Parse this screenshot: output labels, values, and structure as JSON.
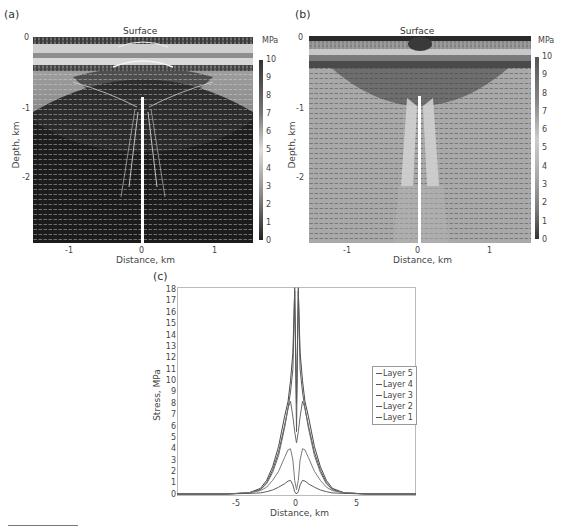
{
  "panels": {
    "a": {
      "label": "(a)",
      "surface_label": "Surface",
      "colorbar_unit": "MPa",
      "colorbar_ticks": [
        "10",
        "9",
        "8",
        "7",
        "6",
        "5",
        "4",
        "3",
        "2",
        "1",
        "0"
      ],
      "y_ticks": [
        "0",
        "-1",
        "-2"
      ],
      "x_ticks": [
        "-1",
        "0",
        "1"
      ],
      "ylabel": "Depth, km",
      "xlabel": "Distance, km",
      "colormap": "dark (low) to light (high)"
    },
    "b": {
      "label": "(b)",
      "surface_label": "Surface",
      "colorbar_unit": "MPa",
      "colorbar_ticks": [
        "10",
        "9",
        "8",
        "7",
        "6",
        "5",
        "4",
        "3",
        "2",
        "1",
        "0"
      ],
      "y_ticks": [
        "0",
        "-1",
        "-2"
      ],
      "x_ticks": [
        "-1",
        "0",
        "1"
      ],
      "ylabel": "Depth, km",
      "xlabel": "Distance, km",
      "colormap": "grey (low) to light/dark (high)"
    },
    "c": {
      "label": "(c)"
    }
  },
  "chart_data": [
    {
      "type": "heatmap",
      "title": "(a)",
      "annotation": "Surface",
      "xlabel": "Distance, km",
      "ylabel": "Depth, km",
      "xlim": [
        -1.5,
        1.5
      ],
      "ylim": [
        -2.9,
        0
      ],
      "x_ticks": [
        -1,
        0,
        1
      ],
      "y_ticks": [
        0,
        -1,
        -2
      ],
      "colorbar": {
        "label": "MPa",
        "range": [
          0,
          10
        ],
        "ticks": [
          0,
          1,
          2,
          3,
          4,
          5,
          6,
          7,
          8,
          9,
          10
        ]
      },
      "overlay": "stress direction vector field (white arrows)"
    },
    {
      "type": "heatmap",
      "title": "(b)",
      "annotation": "Surface",
      "xlabel": "Distance, km",
      "ylabel": "Depth, km",
      "xlim": [
        -1.5,
        1.5
      ],
      "ylim": [
        -2.9,
        0
      ],
      "x_ticks": [
        -1,
        0,
        1
      ],
      "y_ticks": [
        0,
        -1,
        -2
      ],
      "colorbar": {
        "label": "MPa",
        "range": [
          0,
          10
        ],
        "ticks": [
          0,
          1,
          2,
          3,
          4,
          5,
          6,
          7,
          8,
          9,
          10
        ]
      },
      "overlay": "stress direction vector field (dark arrows)"
    },
    {
      "type": "line",
      "title": "(c)",
      "xlabel": "Distance, km",
      "ylabel": "Stress, MPa",
      "xlim": [
        -10,
        10
      ],
      "ylim": [
        0,
        18
      ],
      "x_ticks": [
        -5,
        0,
        5
      ],
      "y_ticks": [
        0,
        1,
        2,
        3,
        4,
        5,
        6,
        7,
        8,
        9,
        10,
        11,
        12,
        13,
        14,
        15,
        16,
        17,
        18
      ],
      "legend_position": "right",
      "x": [
        -10,
        -8,
        -6,
        -4,
        -3,
        -2.5,
        -2,
        -1.5,
        -1,
        -0.7,
        -0.5,
        -0.3,
        -0.15,
        0,
        0.15,
        0.3,
        0.5,
        0.7,
        1,
        1.5,
        2,
        2.5,
        3,
        4,
        6,
        8,
        10
      ],
      "series": [
        {
          "name": "Layer 5",
          "values": [
            0,
            0,
            0,
            0.1,
            0.5,
            1.2,
            2.4,
            4.2,
            6.8,
            8.2,
            10.0,
            12.5,
            17.9,
            8.0,
            17.9,
            12.5,
            10.0,
            8.2,
            6.8,
            4.2,
            2.4,
            1.2,
            0.5,
            0.1,
            0,
            0,
            0
          ]
        },
        {
          "name": "Layer 4",
          "values": [
            0,
            0,
            0,
            0.1,
            0.4,
            1.0,
            2.1,
            3.7,
            6.0,
            7.6,
            9.0,
            11.0,
            18.2,
            5.5,
            18.2,
            11.0,
            9.0,
            7.6,
            6.0,
            3.7,
            2.1,
            1.0,
            0.4,
            0.1,
            0,
            0,
            0
          ]
        },
        {
          "name": "Layer 3",
          "values": [
            0,
            0,
            0,
            0.1,
            0.4,
            0.9,
            1.9,
            3.4,
            5.8,
            7.6,
            8.2,
            6.8,
            5.5,
            4.5,
            5.5,
            6.8,
            8.2,
            7.6,
            5.8,
            3.4,
            1.9,
            0.9,
            0.4,
            0.1,
            0,
            0,
            0
          ]
        },
        {
          "name": "Layer 2",
          "values": [
            0,
            0,
            0,
            0.1,
            0.3,
            0.6,
            1.2,
            2.0,
            3.2,
            3.9,
            4.0,
            3.0,
            1.2,
            0.4,
            1.2,
            3.0,
            4.0,
            3.9,
            3.2,
            2.0,
            1.2,
            0.6,
            0.3,
            0.1,
            0,
            0,
            0
          ]
        },
        {
          "name": "Layer 1",
          "values": [
            0,
            0,
            0,
            0.05,
            0.1,
            0.2,
            0.35,
            0.6,
            0.9,
            1.15,
            1.2,
            0.8,
            0.2,
            0.0,
            0.2,
            0.8,
            1.2,
            1.15,
            0.9,
            0.6,
            0.35,
            0.2,
            0.1,
            0.05,
            0,
            0,
            0
          ]
        }
      ]
    }
  ],
  "chart_c": {
    "ylabel": "Stress, MPa",
    "xlabel": "Distance, km",
    "y_ticks": [
      "18",
      "17",
      "16",
      "15",
      "14",
      "13",
      "12",
      "11",
      "10",
      "9",
      "8",
      "7",
      "6",
      "5",
      "4",
      "3",
      "2",
      "1",
      "0"
    ],
    "x_ticks": [
      "-5",
      "0",
      "5"
    ],
    "legend": [
      "Layer 5",
      "Layer 4",
      "Layer 3",
      "Layer 2",
      "Layer 1"
    ]
  }
}
